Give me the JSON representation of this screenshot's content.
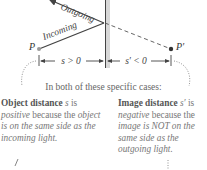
{
  "diagram": {
    "rays": {
      "outgoing_label": "Outgoing",
      "incoming_label": "Incoming"
    },
    "points": {
      "object_label": "P",
      "image_label": "P′"
    },
    "distances": {
      "object_label": "s > 0",
      "image_label": "s′ < 0"
    },
    "colors": {
      "mirror": "#444444",
      "mirror_shade": "#d8d8d8",
      "ray": "#444444",
      "object_point": "#999999",
      "image_point": "#333333",
      "dotted_callout": "#888888"
    }
  },
  "caption": "In both of these specific cases:",
  "notes": {
    "left": {
      "title": "Object distance",
      "symbol": "s",
      "is": " is",
      "sign": "positive",
      "rest1": " because the",
      "reason": "object is on the same side as the incoming light."
    },
    "right": {
      "title": "Image distance",
      "symbol": "s′",
      "is": " is",
      "sign": "negative",
      "rest1": " because the",
      "reason": "image is NOT on the same side as the outgoing light."
    }
  }
}
